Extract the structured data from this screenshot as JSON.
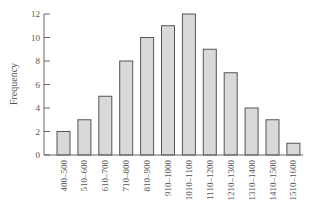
{
  "chart_data": {
    "type": "bar",
    "title": "",
    "xlabel": "",
    "ylabel": "Frequency",
    "categories": [
      "400–500",
      "510–600",
      "610–700",
      "710–800",
      "810–900",
      "910–1000",
      "1010–1100",
      "1110–1200",
      "1210–1300",
      "1310–1400",
      "1410–1500",
      "1510–1600"
    ],
    "values": [
      2,
      3,
      5,
      8,
      10,
      11,
      12,
      9,
      7,
      4,
      3,
      1
    ],
    "ylim": [
      0,
      12
    ],
    "yticks": [
      0,
      2,
      4,
      6,
      8,
      10,
      12
    ],
    "grid": false,
    "legend": null,
    "colors": {
      "bar_fill": "#d9d9d9",
      "bar_stroke": "#555555",
      "axis": "#666666"
    }
  }
}
